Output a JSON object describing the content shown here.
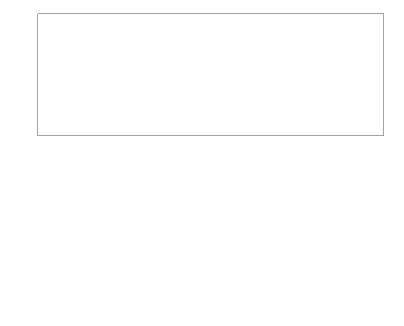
{
  "figure": {
    "background_color": "#ffffff",
    "line_color": "#5a5a5a",
    "axis_color": "#8c8c8c",
    "tick_label_color": "#4d4d4d",
    "width": 404,
    "height": 326
  },
  "chart_data": [
    {
      "type": "line",
      "name": "top-signal",
      "title": "",
      "xlabel": "",
      "ylabel": "",
      "xlim": [
        0,
        1
      ],
      "ylim": [
        -1.15,
        1.15
      ],
      "grid": false,
      "legend": false,
      "xticks": [
        0,
        0.1,
        0.2,
        0.3,
        0.4,
        0.5,
        0.6,
        0.7,
        0.8,
        0.9,
        1
      ],
      "xticklabels": [
        "0",
        "0.1",
        "0.2",
        "0.3",
        "0.4",
        "0.5",
        "0.6",
        "0.7",
        "0.8",
        "0.9",
        "1"
      ],
      "yticks": [
        -1,
        -0.5,
        0,
        0.5,
        1
      ],
      "yticklabels": [
        "−1",
        "−0.5",
        "0",
        "0.5",
        "1"
      ],
      "description": "Slow sine carrier with small-amplitude high-frequency ripple superimposed",
      "model": {
        "carrier_amplitude": 1.0,
        "carrier_cycles": 1.0,
        "carrier_phase": 0.0,
        "ripple_amplitude": 0.055,
        "ripple_cycles": 87,
        "samples": 1400
      }
    },
    {
      "type": "line",
      "name": "bottom-signal",
      "title": "",
      "xlabel": "",
      "ylabel": "",
      "xlim": [
        0,
        1
      ],
      "ylim": [
        -1.15,
        1.15
      ],
      "grid": false,
      "legend": false,
      "xticks": [
        0,
        0.1,
        0.2,
        0.3,
        0.4,
        0.5,
        0.6,
        0.7,
        0.8,
        0.9,
        1
      ],
      "xticklabels": [
        "0",
        "0.1",
        "0.2",
        "0.3",
        "0.4",
        "0.5",
        "0.6",
        "0.7",
        "0.8",
        "0.9",
        "1"
      ],
      "yticks": [
        -1,
        -0.5,
        0,
        0.5,
        1
      ],
      "yticklabels": [
        "−1",
        "−0.5",
        "0",
        "0.5",
        "1"
      ],
      "description": "Gaussian-enveloped linear chirp peaking near x = 0.41, decaying to zero by x = 0.78",
      "model": {
        "envelope_center": 0.41,
        "envelope_width": 0.145,
        "envelope_peak": 1.0,
        "chirp_start_freq": 6,
        "chirp_rate": 130,
        "chirp_phase": 0.0,
        "samples": 2400
      }
    }
  ]
}
